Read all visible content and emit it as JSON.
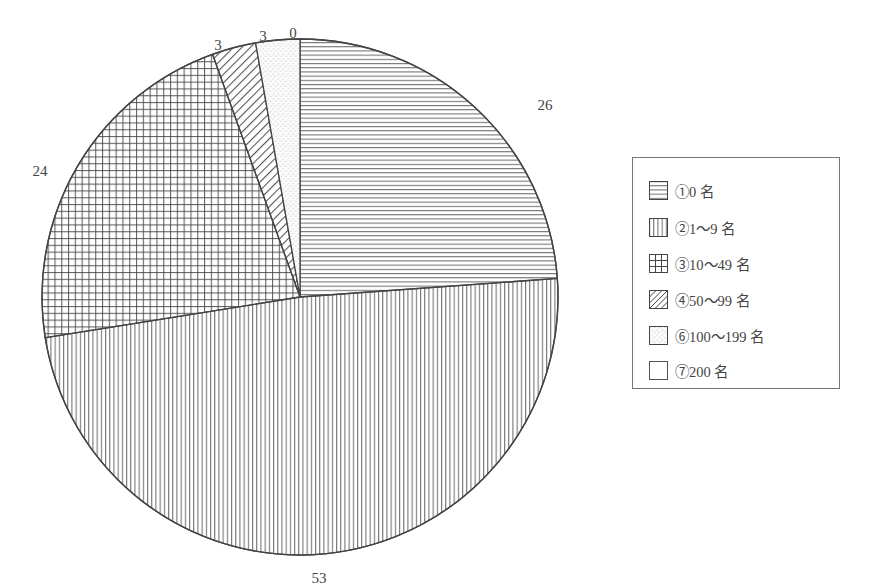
{
  "chart_data": {
    "type": "pie",
    "title": "",
    "categories": [
      "①0名",
      "②1〜9名",
      "③10〜49名",
      "④50〜99名",
      "⑥100〜199名",
      "⑦200名"
    ],
    "values": [
      26,
      53,
      24,
      3,
      3,
      0
    ],
    "series": [
      {
        "name": "①0名",
        "value": 26,
        "pattern": "horizontal-lines"
      },
      {
        "name": "②1〜9名",
        "value": 53,
        "pattern": "vertical-lines"
      },
      {
        "name": "③10〜49名",
        "value": 24,
        "pattern": "grid"
      },
      {
        "name": "④50〜99名",
        "value": 3,
        "pattern": "diagonal-lines"
      },
      {
        "name": "⑥100〜199名",
        "value": 3,
        "pattern": "dots"
      },
      {
        "name": "⑦200名",
        "value": 0,
        "pattern": "blank"
      }
    ],
    "start_angle_deg": 0,
    "direction": "clockwise",
    "legend_position": "right",
    "data_labels": [
      "26",
      "53",
      "24",
      "3",
      "3",
      "0"
    ]
  },
  "labels": {
    "s0": "26",
    "s1": "53",
    "s2": "24",
    "s3": "3",
    "s4": "3",
    "s5": "0"
  },
  "legend": {
    "items": [
      {
        "label": "①0 名",
        "pattern": "horizontal-lines"
      },
      {
        "label": "②1〜9 名",
        "pattern": "vertical-lines"
      },
      {
        "label": "③10〜49 名",
        "pattern": "grid"
      },
      {
        "label": "④50〜99 名",
        "pattern": "diagonal-lines"
      },
      {
        "label": "⑥100〜199 名",
        "pattern": "dots"
      },
      {
        "label": "⑦200 名",
        "pattern": "blank"
      }
    ]
  },
  "colors": {
    "stroke": "#444444",
    "hatch": "#555555",
    "background": "#ffffff"
  }
}
